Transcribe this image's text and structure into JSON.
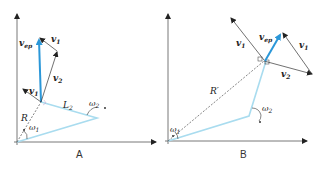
{
  "panels": [
    {
      "caption": "A",
      "labels": {
        "v_ep": "v",
        "v_ep_sub": "ep",
        "v1_top": "v",
        "v1_top_sub": "1",
        "v2": "v",
        "v2_sub": "2",
        "v1_left": "v",
        "v1_left_sub": "1",
        "L2": "L",
        "L2_sub": "2",
        "R": "R",
        "omega1": "ω",
        "omega1_sub": "1",
        "omega2": "ω",
        "omega2_sub": "2"
      }
    },
    {
      "caption": "B",
      "labels": {
        "v_ep": "v",
        "v_ep_sub": "ep",
        "v1_left": "v",
        "v1_left_sub": "1",
        "v1_right": "v",
        "v1_right_sub": "1",
        "v2": "v",
        "v2_sub": "2",
        "R": "R′",
        "omega1": "ω",
        "omega1_sub": "1",
        "omega2": "ω",
        "omega2_sub": "2"
      }
    }
  ],
  "colors": {
    "arm": "#a9dcef",
    "v_ep": "#2b97d8",
    "vector": "#333333",
    "axis": "#555555"
  }
}
